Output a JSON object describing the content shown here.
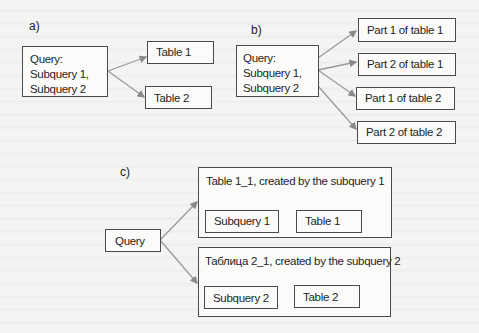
{
  "panels": {
    "a": {
      "label": "a)",
      "query": {
        "lines": [
          "Query:",
          "Subquery 1,",
          "Subquery 2"
        ]
      },
      "targets": [
        "Table 1",
        "Table 2"
      ]
    },
    "b": {
      "label": "b)",
      "query": {
        "lines": [
          "Query:",
          "Subquery 1,",
          "Subquery 2"
        ]
      },
      "targets": [
        "Part 1 of table 1",
        "Part 2 of table 1",
        "Part 1 of table 2",
        "Part 2 of table 2"
      ]
    },
    "c": {
      "label": "c)",
      "query": "Query",
      "groups": [
        {
          "title": "Table 1_1, created by the subquery 1",
          "source": "Subquery 1",
          "target": "Table 1"
        },
        {
          "title": "Таблица 2_1, created by the subquery 2",
          "source": "Subquery 2",
          "target": "Table 2"
        }
      ]
    }
  },
  "colors": {
    "border": "#4a4a4a",
    "arrow": "#9a9a9a",
    "background": "#f4f4f2"
  }
}
